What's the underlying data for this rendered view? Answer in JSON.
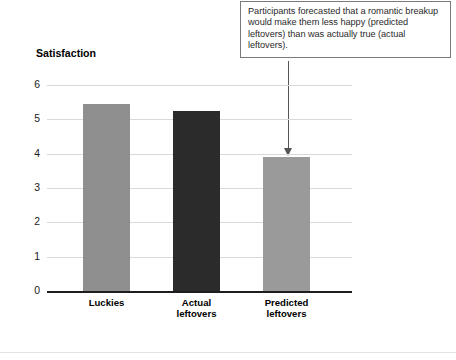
{
  "figure": {
    "annotation": {
      "text": "Participants forecasted that a romantic breakup would make them less happy (predicted leftovers) than was actually true (actual leftovers).",
      "points_to": "Predicted leftovers",
      "border_color": "#7a7a7a",
      "leader_color": "#555555"
    },
    "axis_title": "Satisfaction",
    "colors": {
      "bar_gray": "#8f8f8f",
      "bar_dark": "#2b2b2b",
      "bar_light_gray": "#9a9a9a",
      "gridline": "#d9d9d9",
      "axis": "#1d1d1d"
    }
  },
  "chart_data": {
    "type": "bar",
    "title": "",
    "xlabel": "",
    "ylabel": "Satisfaction",
    "categories": [
      "Luckies",
      "Actual leftovers",
      "Predicted leftovers"
    ],
    "category_lines": [
      [
        "Luckies"
      ],
      [
        "Actual",
        "leftovers"
      ],
      [
        "Predicted",
        "leftovers"
      ]
    ],
    "values": [
      5.45,
      5.25,
      3.9
    ],
    "bar_colors": [
      "#8f8f8f",
      "#2b2b2b",
      "#9a9a9a"
    ],
    "ylim": [
      0,
      6
    ],
    "yticks": [
      0,
      1,
      2,
      3,
      4,
      5,
      6
    ],
    "ytick_labels": [
      "0",
      "1",
      "2",
      "3",
      "4",
      "5",
      "6"
    ],
    "grid": true,
    "legend": "none",
    "annotations": [
      {
        "text": "Participants forecasted that a romantic breakup would make them less happy (predicted leftovers) than was actually true (actual leftovers).",
        "target_category": "Predicted leftovers"
      }
    ]
  }
}
